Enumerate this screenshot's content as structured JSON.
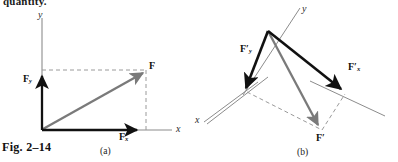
{
  "page": {
    "body_text_fragment": "quantity.",
    "figure_caption": "Fig. 2–14",
    "width": 398,
    "height": 162,
    "background": "#ffffff"
  },
  "colors": {
    "axis_gray": "#8c8c8c",
    "vector_black": "#111111",
    "resultant_gray": "#7a7a7a",
    "dashed_gray": "#9a9a9a",
    "text_black": "#111111"
  },
  "panels": [
    {
      "id": "a",
      "label": "(a)",
      "axes": {
        "x_label": "x",
        "y_label": "y",
        "orientation_deg": 0
      },
      "vectors": [
        {
          "name": "resultant",
          "label": "F",
          "label_html": "F",
          "color": "#7a7a7a",
          "style": "solid"
        },
        {
          "name": "x-component",
          "label": "Fx",
          "label_html": "F<sub>x</sub>",
          "color": "#111111",
          "style": "solid"
        },
        {
          "name": "y-component",
          "label": "Fy",
          "label_html": "F<sub>y</sub>",
          "color": "#111111",
          "style": "solid"
        }
      ],
      "construction_lines": "dashed rectangle completing the component parallelogram"
    },
    {
      "id": "b",
      "label": "(b)",
      "axes": {
        "x_label": "x",
        "y_label": "y",
        "orientation_deg": -40
      },
      "vectors": [
        {
          "name": "resultant",
          "label": "F'",
          "label_html": "F<span class=\"prime\">′</span>",
          "color": "#7a7a7a",
          "style": "solid"
        },
        {
          "name": "x-component",
          "label": "F'x",
          "label_html": "F<span class=\"prime\">′</span><sub>x</sub>",
          "color": "#111111",
          "style": "solid"
        },
        {
          "name": "y-component",
          "label": "F'y",
          "label_html": "F<span class=\"prime\">′</span><sub>y</sub>",
          "color": "#111111",
          "style": "solid"
        }
      ],
      "construction_lines": "dashed parallelogram completing the rotated components"
    }
  ],
  "labels": {
    "a_F": "F",
    "a_Fx": "F",
    "a_Fx_sub": "x",
    "a_Fy": "F",
    "a_Fy_sub": "y",
    "a_axis_x": "x",
    "a_axis_y": "y",
    "b_F": "F",
    "b_F_prime": "′",
    "b_Fx": "F",
    "b_Fx_prime": "′",
    "b_Fx_sub": "x",
    "b_Fy": "F",
    "b_Fy_prime": "′",
    "b_Fy_sub": "y",
    "b_axis_x": "x",
    "b_axis_y": "y"
  }
}
